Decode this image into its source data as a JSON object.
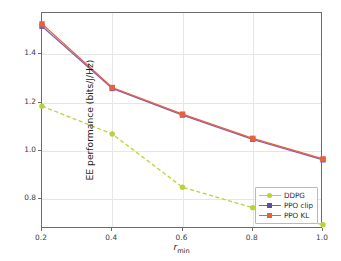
{
  "chart_data": {
    "type": "line",
    "title": "",
    "xlabel": "r_min",
    "xlabel_base": "r",
    "xlabel_sub": "min",
    "ylabel": "EE performance (bits/J/Hz)",
    "x": [
      0.2,
      0.4,
      0.6,
      0.8,
      1.0
    ],
    "xticks": [
      "0.2",
      "0.4",
      "0.6",
      "0.8",
      "1.0"
    ],
    "yticks": [
      "0.8",
      "1.0",
      "1.2",
      "1.4"
    ],
    "ytick_values": [
      0.8,
      1.0,
      1.2,
      1.4
    ],
    "xlim": [
      0.2,
      1.0
    ],
    "ylim": [
      0.6772,
      1.5699
    ],
    "grid": true,
    "legend_position": "lower right",
    "series": [
      {
        "name": "DDPG",
        "color": "#b9d336",
        "marker": "circle",
        "linestyle": "dashed",
        "values": [
          1.185,
          1.07,
          0.85,
          0.765,
          0.695
        ]
      },
      {
        "name": "PPO clip",
        "color": "#7b5fbe",
        "marker": "square",
        "linestyle": "solid",
        "values": [
          1.515,
          1.258,
          1.148,
          1.048,
          0.963
        ]
      },
      {
        "name": "PPO KL",
        "color": "#e8603c",
        "marker": "square",
        "linestyle": "solid",
        "values": [
          1.525,
          1.262,
          1.152,
          1.052,
          0.967
        ]
      }
    ]
  },
  "legend": {
    "items": [
      {
        "label": "DDPG"
      },
      {
        "label": "PPO clip"
      },
      {
        "label": "PPO KL"
      }
    ]
  },
  "axes": {
    "frame_color": "#6b6b6b",
    "grid_color": "#e6e6e6"
  }
}
